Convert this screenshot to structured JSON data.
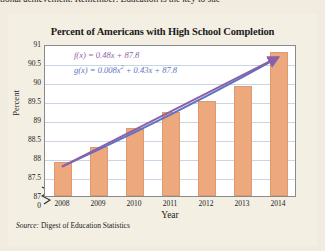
{
  "page": {
    "top_sentence": "tional achievement. Remember: Education is the key to suc",
    "background_color": "#f2ece0"
  },
  "figure": {
    "title": "Percent of Americans with High School Completion",
    "source_prefix": "Source:",
    "source_text": "Digest of Education Statistics",
    "equations": [
      {
        "name": "f-equation",
        "text": "f(x) = 0.48x + 87.8",
        "color": "#8d5fa6"
      },
      {
        "name": "g-equation",
        "text": "g(x) = 0.008x² + 0.43x + 87.8",
        "color": "#5b73c4"
      }
    ],
    "axis_break_label": "0"
  },
  "chart_data": {
    "type": "bar",
    "title": "Percent of Americans with High School Completion",
    "xlabel": "Year",
    "ylabel": "Percent",
    "categories": [
      "2008",
      "2009",
      "2010",
      "2011",
      "2012",
      "2013",
      "2014"
    ],
    "values": [
      87.9,
      88.3,
      88.8,
      89.2,
      89.5,
      89.9,
      90.8
    ],
    "ylim": [
      87,
      91
    ],
    "yticks": [
      "87",
      "87.5",
      "88",
      "88.5",
      "89",
      "89.5",
      "90",
      "90.5",
      "91"
    ],
    "ytick_values": [
      87,
      87.5,
      88,
      88.5,
      89,
      89.5,
      90,
      90.5,
      91
    ],
    "axis_break": true,
    "grid": true,
    "legend": "none",
    "bar_color": "#eda87d",
    "series": [
      {
        "name": "High school completion",
        "type": "bar",
        "values": [
          87.9,
          88.3,
          88.8,
          89.2,
          89.5,
          89.9,
          90.8
        ]
      },
      {
        "name": "f(x) = 0.48x + 87.8",
        "type": "line",
        "color": "#8d5fa6",
        "model": "linear",
        "coefficients": [
          0.48,
          87.8
        ],
        "x": [
          0,
          1,
          2,
          3,
          4,
          5,
          6
        ],
        "values": [
          87.8,
          88.28,
          88.76,
          89.24,
          89.72,
          90.2,
          90.68
        ]
      },
      {
        "name": "g(x) = 0.008x² + 0.43x + 87.8",
        "type": "line",
        "color": "#5b73c4",
        "model": "quadratic",
        "coefficients": [
          0.008,
          0.43,
          87.8
        ],
        "x": [
          0,
          1,
          2,
          3,
          4,
          5,
          6
        ],
        "values": [
          87.8,
          88.238,
          88.692,
          89.162,
          89.648,
          90.15,
          90.668
        ]
      }
    ]
  }
}
